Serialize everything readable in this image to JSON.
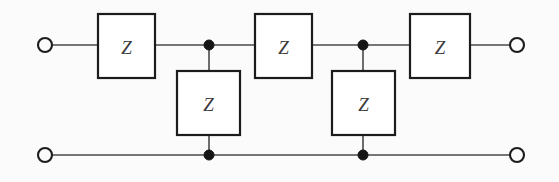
{
  "diagram": {
    "type": "electrical-circuit-schematic",
    "background_color": "#fbfbfb",
    "line_color": "#4a4a4a",
    "box_border_color": "#1c1c1c",
    "box_fill_color": "#ffffff",
    "label_color": "#3b3b3b",
    "junction_color": "#151515",
    "width": 559,
    "height": 182
  },
  "rails": {
    "top": {
      "name": "top-rail",
      "y": 45,
      "x_start": 52,
      "x_end": 510
    },
    "bottom": {
      "name": "bottom-rail",
      "y": 155,
      "x_start": 52,
      "x_end": 510
    }
  },
  "terminals": [
    {
      "id": "terminal-top-left",
      "label": "",
      "cx": 45,
      "cy": 45,
      "r": 7
    },
    {
      "id": "terminal-top-right",
      "label": "",
      "cx": 517,
      "cy": 45,
      "r": 7
    },
    {
      "id": "terminal-bottom-left",
      "label": "",
      "cx": 45,
      "cy": 155,
      "r": 7
    },
    {
      "id": "terminal-bottom-right",
      "label": "",
      "cx": 517,
      "cy": 155,
      "r": 7
    }
  ],
  "junctions": [
    {
      "id": "junction-top-1",
      "cx": 209,
      "cy": 45,
      "r": 5
    },
    {
      "id": "junction-top-2",
      "cx": 363,
      "cy": 45,
      "r": 5
    },
    {
      "id": "junction-bottom-1",
      "cx": 209,
      "cy": 155,
      "r": 5
    },
    {
      "id": "junction-bottom-2",
      "cx": 363,
      "cy": 155,
      "r": 5
    }
  ],
  "components": [
    {
      "id": "series-impedance-1",
      "label": "Z",
      "orientation": "series",
      "x": 98,
      "y": 14,
      "width": 57,
      "height": 64
    },
    {
      "id": "shunt-impedance-1",
      "label": "Z",
      "orientation": "shunt",
      "x": 177,
      "y": 71,
      "width": 63,
      "height": 64
    },
    {
      "id": "series-impedance-2",
      "label": "Z",
      "orientation": "series",
      "x": 255,
      "y": 14,
      "width": 57,
      "height": 64
    },
    {
      "id": "shunt-impedance-2",
      "label": "Z",
      "orientation": "shunt",
      "x": 332,
      "y": 71,
      "width": 63,
      "height": 64
    },
    {
      "id": "series-impedance-3",
      "label": "Z",
      "orientation": "series",
      "x": 410,
      "y": 14,
      "width": 60,
      "height": 64
    }
  ],
  "wire_segments": [
    {
      "id": "wire-top-terminal-to-z1",
      "x1": 52,
      "y1": 45,
      "x2": 98,
      "y2": 45
    },
    {
      "id": "wire-z1-to-junction1",
      "x1": 155,
      "y1": 45,
      "x2": 209,
      "y2": 45
    },
    {
      "id": "wire-junction1-to-z2",
      "x1": 209,
      "y1": 45,
      "x2": 255,
      "y2": 45
    },
    {
      "id": "wire-z2-to-junction2",
      "x1": 312,
      "y1": 45,
      "x2": 363,
      "y2": 45
    },
    {
      "id": "wire-junction2-to-z3",
      "x1": 363,
      "y1": 45,
      "x2": 410,
      "y2": 45
    },
    {
      "id": "wire-z3-to-top-terminal",
      "x1": 470,
      "y1": 45,
      "x2": 510,
      "y2": 45
    },
    {
      "id": "wire-shunt1-upper",
      "x1": 209,
      "y1": 45,
      "x2": 209,
      "y2": 71
    },
    {
      "id": "wire-shunt1-lower",
      "x1": 209,
      "y1": 135,
      "x2": 209,
      "y2": 155
    },
    {
      "id": "wire-shunt2-upper",
      "x1": 363,
      "y1": 45,
      "x2": 363,
      "y2": 71
    },
    {
      "id": "wire-shunt2-lower",
      "x1": 363,
      "y1": 135,
      "x2": 363,
      "y2": 155
    },
    {
      "id": "wire-bottom-left",
      "x1": 52,
      "y1": 155,
      "x2": 209,
      "y2": 155
    },
    {
      "id": "wire-bottom-middle",
      "x1": 209,
      "y1": 155,
      "x2": 363,
      "y2": 155
    },
    {
      "id": "wire-bottom-right",
      "x1": 363,
      "y1": 155,
      "x2": 510,
      "y2": 155
    }
  ]
}
